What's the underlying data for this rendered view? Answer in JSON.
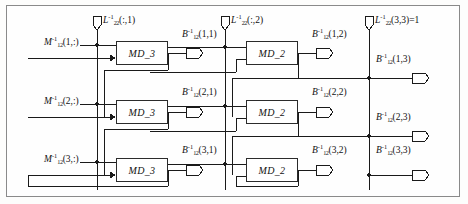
{
  "diagram": {
    "type": "signal-flow-block-diagram",
    "colors": {
      "frame_border": "#8a8a8a",
      "wire": "#1a1a1a",
      "block_border": "#2b2b2b",
      "background": "#fdfdfc",
      "text": "#111111"
    }
  },
  "bus_inputs": [
    {
      "id": "bus-1",
      "base": "L",
      "sup": "-1",
      "sub": "22",
      "arg": "(:,1)",
      "suffix": "",
      "x": 94,
      "y": 16
    },
    {
      "id": "bus-2",
      "base": "L",
      "sup": "-1",
      "sub": "22",
      "arg": "(:,2)",
      "suffix": "",
      "x": 222,
      "y": 16
    },
    {
      "id": "bus-3",
      "base": "L",
      "sup": "-1",
      "sub": "22",
      "arg": "(3,3)",
      "suffix": "=1",
      "x": 366,
      "y": 16
    }
  ],
  "row_inputs": [
    {
      "id": "row-in-1",
      "base": "M",
      "sup": "-1",
      "sub": "12",
      "arg": "(1,:)",
      "x": 44,
      "y": 40
    },
    {
      "id": "row-in-2",
      "base": "M",
      "sup": "-1",
      "sub": "12",
      "arg": "(2,:)",
      "x": 44,
      "y": 101
    },
    {
      "id": "row-in-3",
      "base": "M",
      "sup": "-1",
      "sub": "12",
      "arg": "(3,:)",
      "x": 44,
      "y": 158
    }
  ],
  "blocks": [
    {
      "id": "md3-r1",
      "label": "MD_3",
      "x": 116,
      "y": 41,
      "w": 52,
      "h": 24
    },
    {
      "id": "md3-r2",
      "label": "MD_3",
      "x": 116,
      "y": 100,
      "w": 52,
      "h": 24
    },
    {
      "id": "md3-r3",
      "label": "MD_3",
      "x": 116,
      "y": 158,
      "w": 52,
      "h": 24
    },
    {
      "id": "md2-r1",
      "label": "MD_2",
      "x": 246,
      "y": 41,
      "w": 52,
      "h": 24
    },
    {
      "id": "md2-r2",
      "label": "MD_2",
      "x": 246,
      "y": 100,
      "w": 52,
      "h": 24
    },
    {
      "id": "md2-r3",
      "label": "MD_2",
      "x": 246,
      "y": 158,
      "w": 52,
      "h": 24
    }
  ],
  "outputs": [
    {
      "id": "out-1-1",
      "base": "B",
      "sup": "-1",
      "sub": "12",
      "arg": "(1,1)",
      "x": 182,
      "y": 31,
      "flag_x": 186,
      "flag_y": 50
    },
    {
      "id": "out-2-1",
      "base": "B",
      "sup": "-1",
      "sub": "12",
      "arg": "(2,1)",
      "x": 182,
      "y": 89,
      "flag_x": 186,
      "flag_y": 109
    },
    {
      "id": "out-3-1",
      "base": "B",
      "sup": "-1",
      "sub": "12",
      "arg": "(3,1)",
      "x": 182,
      "y": 147,
      "flag_x": 186,
      "flag_y": 167
    },
    {
      "id": "out-1-2",
      "base": "B",
      "sup": "-1",
      "sub": "12",
      "arg": "(1,2)",
      "x": 312,
      "y": 31,
      "flag_x": 316,
      "flag_y": 50
    },
    {
      "id": "out-2-2",
      "base": "B",
      "sup": "-1",
      "sub": "12",
      "arg": "(2,2)",
      "x": 312,
      "y": 89,
      "flag_x": 316,
      "flag_y": 109
    },
    {
      "id": "out-3-2",
      "base": "B",
      "sup": "-1",
      "sub": "12",
      "arg": "(3,2)",
      "x": 312,
      "y": 147,
      "flag_x": 316,
      "flag_y": 167
    },
    {
      "id": "out-1-3",
      "base": "B",
      "sup": "-1",
      "sub": "12",
      "arg": "(1,3)",
      "x": 368,
      "y": 56,
      "flag_x": 412,
      "flag_y": 75
    },
    {
      "id": "out-2-3",
      "base": "B",
      "sup": "-1",
      "sub": "12",
      "arg": "(2,3)",
      "x": 368,
      "y": 114,
      "flag_x": 412,
      "flag_y": 133
    },
    {
      "id": "out-3-3",
      "base": "B",
      "sup": "-1",
      "sub": "12",
      "arg": "(3,3)",
      "x": 368,
      "y": 147,
      "flag_x": 412,
      "flag_y": 172
    }
  ]
}
